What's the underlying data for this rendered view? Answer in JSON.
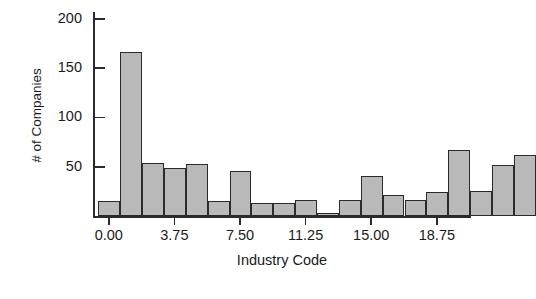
{
  "chart_data": {
    "type": "bar",
    "title": "",
    "subtitle": "",
    "xlabel": "Industry Code",
    "ylabel": "# of Companies",
    "xlim": [
      -0.9,
      20.7
    ],
    "ylim": [
      0,
      207
    ],
    "grid": false,
    "legend": null,
    "bin_width": 1.25,
    "xticks": [
      0.0,
      3.75,
      7.5,
      11.25,
      15.0,
      18.75
    ],
    "xtick_labels": [
      "0.00",
      "3.75",
      "7.50",
      "11.25",
      "15.00",
      "18.75"
    ],
    "yticks": [
      50,
      100,
      150,
      200
    ],
    "ytick_labels": [
      "50",
      "100",
      "150",
      "200"
    ],
    "bar_fill": "#b9b9b9",
    "bar_edge": "#2b2b2b",
    "axis_color": "#2b2b2b",
    "bins": [
      {
        "x_left": -0.6,
        "x_right": 0.65,
        "value": 15
      },
      {
        "x_left": 0.65,
        "x_right": 1.9,
        "value": 166
      },
      {
        "x_left": 1.9,
        "x_right": 3.15,
        "value": 54
      },
      {
        "x_left": 3.15,
        "x_right": 4.4,
        "value": 49
      },
      {
        "x_left": 4.4,
        "x_right": 5.65,
        "value": 53
      },
      {
        "x_left": 5.65,
        "x_right": 6.9,
        "value": 15
      },
      {
        "x_left": 6.9,
        "x_right": 8.15,
        "value": 46
      },
      {
        "x_left": 8.15,
        "x_right": 9.4,
        "value": 13
      },
      {
        "x_left": 9.4,
        "x_right": 10.65,
        "value": 13
      },
      {
        "x_left": 10.65,
        "x_right": 11.9,
        "value": 16
      },
      {
        "x_left": 11.9,
        "x_right": 13.15,
        "value": 3
      },
      {
        "x_left": 13.15,
        "x_right": 14.4,
        "value": 16
      },
      {
        "x_left": 14.4,
        "x_right": 15.65,
        "value": 41
      },
      {
        "x_left": 15.65,
        "x_right": 16.9,
        "value": 21
      },
      {
        "x_left": 16.9,
        "x_right": 18.15,
        "value": 16
      },
      {
        "x_left": 18.15,
        "x_right": 19.4,
        "value": 24
      },
      {
        "x_left": 19.4,
        "x_right": 20.65,
        "value": 67
      },
      {
        "x_left": 20.65,
        "x_right": 21.9,
        "value": 25
      },
      {
        "x_left": 21.9,
        "x_right": 23.15,
        "value": 52
      },
      {
        "x_left": 23.15,
        "x_right": 24.4,
        "value": 62
      }
    ],
    "categories": [
      "0.0",
      "1.25",
      "2.5",
      "3.75",
      "5.0",
      "6.25",
      "7.5",
      "8.75",
      "10.0",
      "11.25",
      "12.5",
      "13.75",
      "15.0",
      "16.25",
      "17.5",
      "18.75",
      "20.0",
      "21.25",
      "22.5",
      "23.75"
    ],
    "values": [
      15,
      166,
      54,
      49,
      53,
      15,
      46,
      13,
      13,
      16,
      3,
      16,
      41,
      21,
      16,
      24,
      67,
      25,
      52,
      62
    ]
  }
}
